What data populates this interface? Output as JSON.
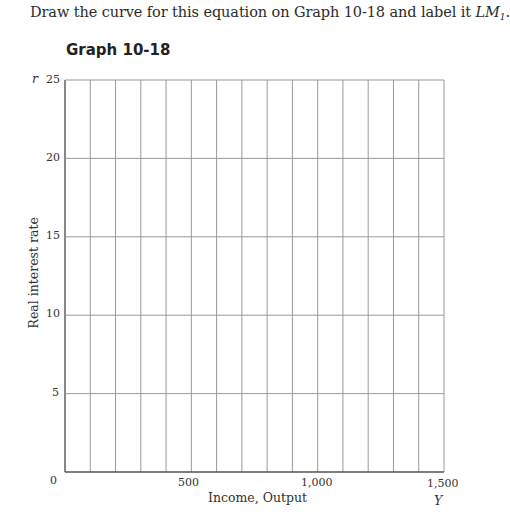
{
  "instruction": {
    "text": "Draw the curve for this equation on Graph 10-18 and label it ",
    "curve_label": "LM",
    "curve_subscript": "1",
    "end": "."
  },
  "graph": {
    "title": "Graph 10-18",
    "y_axis_variable": "r",
    "x_axis_variable": "Y",
    "y_axis_label": "Real interest rate",
    "x_axis_label": "Income, Output",
    "origin_label": "0",
    "y_ticks": [
      "25",
      "20",
      "15",
      "10",
      "5"
    ],
    "x_ticks": [
      "500",
      "1,000",
      "1,500"
    ],
    "grid_color": "#9a9a9a",
    "axis_color": "#555555"
  },
  "chart_data": {
    "type": "line",
    "title": "Graph 10-18",
    "xlabel": "Income, Output",
    "ylabel": "Real interest rate",
    "x_variable": "Y",
    "y_variable": "r",
    "xlim": [
      0,
      1500
    ],
    "ylim": [
      0,
      25
    ],
    "x_ticks": [
      0,
      500,
      1000,
      1500
    ],
    "y_ticks": [
      0,
      5,
      10,
      15,
      20,
      25
    ],
    "grid": true,
    "x_grid_step": 100,
    "y_grid_step": 5,
    "series": [],
    "note": "Blank grid for student to draw LM1 curve"
  }
}
